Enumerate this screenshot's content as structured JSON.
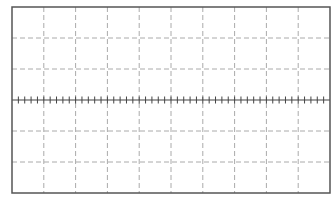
{
  "graticule": {
    "frame": {
      "x": 12,
      "y": 7,
      "width": 318,
      "height": 186
    },
    "columns": 10,
    "rows": 6,
    "minor_ticks_per_division": 5,
    "tick_height": 7,
    "colors": {
      "background": "#ffffff",
      "frame": "#555555",
      "grid": "#aaaaaa",
      "center_axis": "#444444"
    },
    "grid_dash": "5,3"
  }
}
